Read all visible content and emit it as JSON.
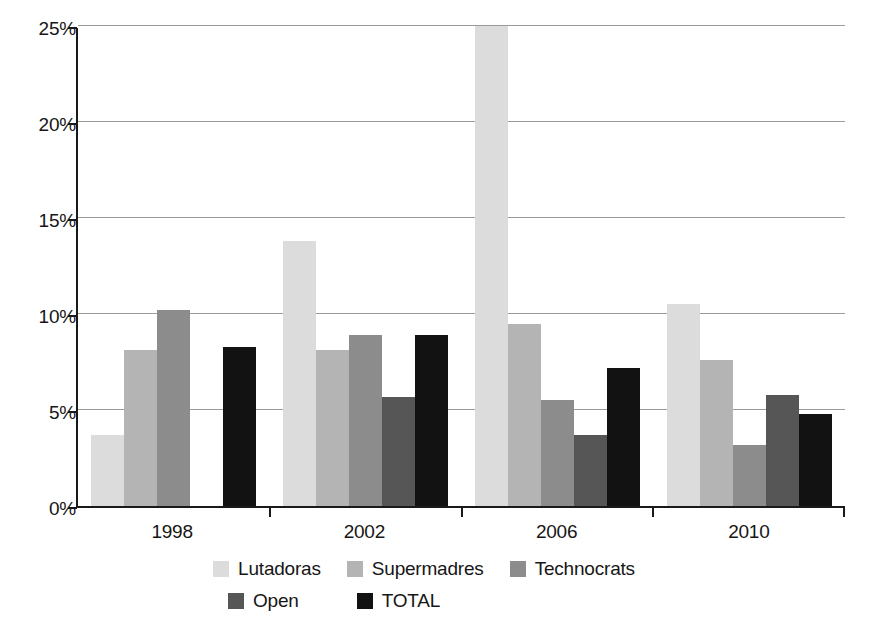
{
  "chart_data": {
    "type": "bar",
    "title": "",
    "subtitle": "",
    "xlabel": "",
    "ylabel": "",
    "categories": [
      "1998",
      "2002",
      "2006",
      "2010"
    ],
    "series": [
      {
        "name": "Lutadoras",
        "color": "#dcdcdc",
        "values": [
          3.7,
          13.8,
          27.5,
          10.5
        ],
        "clipped": [
          false,
          false,
          true,
          false
        ]
      },
      {
        "name": "Supermadres",
        "color": "#b4b4b4",
        "values": [
          8.1,
          8.1,
          9.5,
          7.6
        ],
        "clipped": [
          false,
          false,
          false,
          false
        ]
      },
      {
        "name": "Technocrats",
        "color": "#8c8c8c",
        "values": [
          10.2,
          8.9,
          5.5,
          3.2
        ],
        "clipped": [
          false,
          false,
          false,
          false
        ]
      },
      {
        "name": "Open",
        "color": "#565656",
        "values": [
          0,
          5.7,
          3.7,
          5.8
        ],
        "clipped": [
          false,
          false,
          false,
          false
        ]
      },
      {
        "name": "TOTAL",
        "color": "#121212",
        "values": [
          8.3,
          8.9,
          7.2,
          4.8
        ],
        "clipped": [
          false,
          false,
          false,
          false
        ]
      }
    ],
    "ylim": [
      0,
      25
    ],
    "y_ticks": [
      0,
      5,
      10,
      15,
      20,
      25
    ],
    "y_tick_labels": [
      "0%",
      "5%",
      "10%",
      "15%",
      "20%",
      "25%"
    ],
    "grid": true,
    "grid_axis": "y",
    "legend_position": "bottom",
    "note_2006_lutadoras": "bar exceeds 25% axis maximum and is clipped at the plot top"
  },
  "axis": {
    "y_labels": [
      "25%",
      "20%",
      "15%",
      "10%",
      "5%",
      "0%"
    ],
    "x_labels": [
      "1998",
      "2002",
      "2006",
      "2010"
    ]
  },
  "legend": {
    "row1": [
      {
        "label": "Lutadoras",
        "color": "#dcdcdc"
      },
      {
        "label": "Supermadres",
        "color": "#b4b4b4"
      },
      {
        "label": "Technocrats",
        "color": "#8c8c8c"
      }
    ],
    "row2": [
      {
        "label": "Open",
        "color": "#565656"
      },
      {
        "label": "TOTAL",
        "color": "#121212"
      }
    ]
  }
}
